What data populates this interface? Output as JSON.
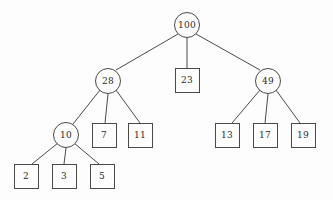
{
  "diagram": {
    "type": "tree",
    "width": 333,
    "height": 200,
    "background_color": "#fdfdfd",
    "stroke_color": "#4a4a4a",
    "text_color": "#2b2b2b",
    "nodes": [
      {
        "id": "n100",
        "label": "100",
        "shape": "circle",
        "cx": 187,
        "cy": 25,
        "r": 13
      },
      {
        "id": "n28",
        "label": "28",
        "shape": "circle",
        "cx": 108,
        "cy": 81,
        "r": 13
      },
      {
        "id": "n23",
        "label": "23",
        "shape": "square",
        "cx": 187,
        "cy": 80,
        "size": 25
      },
      {
        "id": "n49",
        "label": "49",
        "shape": "circle",
        "cx": 268,
        "cy": 81,
        "r": 13
      },
      {
        "id": "n10",
        "label": "10",
        "shape": "circle",
        "cx": 66,
        "cy": 135,
        "r": 13
      },
      {
        "id": "n7",
        "label": "7",
        "shape": "square",
        "cx": 104,
        "cy": 135,
        "size": 25
      },
      {
        "id": "n11",
        "label": "11",
        "shape": "square",
        "cx": 140,
        "cy": 135,
        "size": 25
      },
      {
        "id": "n13",
        "label": "13",
        "shape": "square",
        "cx": 227,
        "cy": 135,
        "size": 25
      },
      {
        "id": "n17",
        "label": "17",
        "shape": "square",
        "cx": 265,
        "cy": 135,
        "size": 25
      },
      {
        "id": "n19",
        "label": "19",
        "shape": "square",
        "cx": 303,
        "cy": 135,
        "size": 25
      },
      {
        "id": "n2",
        "label": "2",
        "shape": "square",
        "cx": 26,
        "cy": 176,
        "size": 25
      },
      {
        "id": "n3",
        "label": "3",
        "shape": "square",
        "cx": 64,
        "cy": 176,
        "size": 25
      },
      {
        "id": "n5",
        "label": "5",
        "shape": "square",
        "cx": 102,
        "cy": 176,
        "size": 25
      }
    ],
    "edges": [
      {
        "from": "n100",
        "to": "n28",
        "x1": 178,
        "y1": 34,
        "x2": 116,
        "y2": 70
      },
      {
        "from": "n100",
        "to": "n23",
        "x1": 187,
        "y1": 38,
        "x2": 187,
        "y2": 68
      },
      {
        "from": "n100",
        "to": "n49",
        "x1": 196,
        "y1": 34,
        "x2": 260,
        "y2": 70
      },
      {
        "from": "n28",
        "to": "n10",
        "x1": 100,
        "y1": 90,
        "x2": 73,
        "y2": 124
      },
      {
        "from": "n28",
        "to": "n7",
        "x1": 108,
        "y1": 94,
        "x2": 105,
        "y2": 123
      },
      {
        "from": "n28",
        "to": "n11",
        "x1": 116,
        "y1": 90,
        "x2": 140,
        "y2": 123
      },
      {
        "from": "n49",
        "to": "n13",
        "x1": 260,
        "y1": 90,
        "x2": 232,
        "y2": 123
      },
      {
        "from": "n49",
        "to": "n17",
        "x1": 268,
        "y1": 94,
        "x2": 265,
        "y2": 123
      },
      {
        "from": "n49",
        "to": "n19",
        "x1": 276,
        "y1": 90,
        "x2": 300,
        "y2": 123
      },
      {
        "from": "n10",
        "to": "n2",
        "x1": 58,
        "y1": 143,
        "x2": 32,
        "y2": 164
      },
      {
        "from": "n10",
        "to": "n3",
        "x1": 66,
        "y1": 148,
        "x2": 64,
        "y2": 164
      },
      {
        "from": "n10",
        "to": "n5",
        "x1": 74,
        "y1": 143,
        "x2": 99,
        "y2": 164
      }
    ]
  }
}
